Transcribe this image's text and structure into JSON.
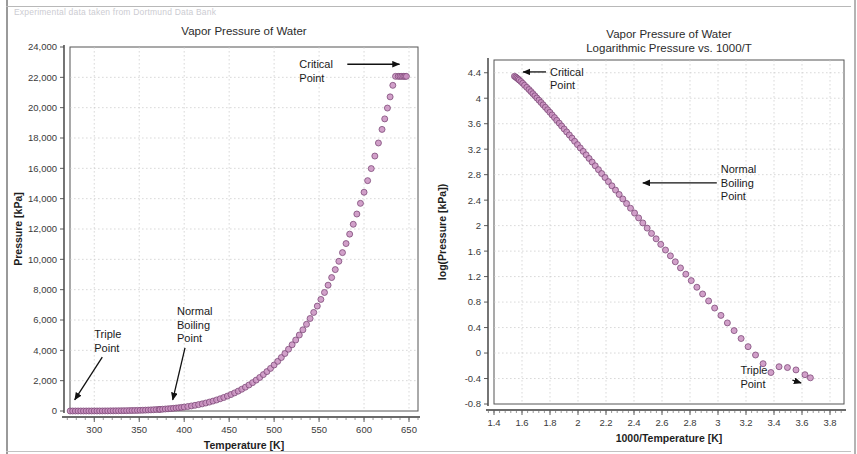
{
  "document": {
    "caption_note": "Experimental data taken from Dortmund Data Bank"
  },
  "chart_data": [
    {
      "id": "left",
      "type": "scatter",
      "title": "Vapor Pressure of Water",
      "xlabel": "Temperature [K]",
      "ylabel": "Pressure [kPa]",
      "xlim": [
        273,
        660
      ],
      "ylim": [
        0,
        24000
      ],
      "xticks": [
        300,
        350,
        400,
        450,
        500,
        550,
        600,
        650
      ],
      "xtick_labels": [
        "300",
        "350",
        "400",
        "450",
        "500",
        "550",
        "600",
        "650"
      ],
      "yticks": [
        0,
        2000,
        4000,
        6000,
        8000,
        10000,
        12000,
        14000,
        16000,
        18000,
        20000,
        22000,
        24000
      ],
      "ytick_labels": [
        "0",
        "2,000",
        "4,000",
        "6,000",
        "8,000",
        "10,000",
        "12,000",
        "14,000",
        "16,000",
        "18,000",
        "20,000",
        "22,000",
        "24,000"
      ],
      "grid": true,
      "legend": "none",
      "marker_color": "#c98fc0",
      "marker_edge_color": "#7d4a78",
      "series": [
        {
          "name": "Vapor pressure of water",
          "x": [
            273.2,
            276.0,
            279.0,
            282.0,
            285.0,
            288.0,
            291.0,
            294.0,
            297.0,
            300.0,
            303.0,
            306.0,
            309.0,
            312.0,
            315.0,
            318.0,
            321.0,
            324.0,
            327.0,
            330.0,
            333.0,
            336.0,
            339.0,
            342.0,
            345.0,
            348.0,
            351.0,
            354.0,
            357.0,
            360.0,
            363.0,
            366.0,
            369.0,
            372.0,
            373.15,
            376.0,
            379.0,
            382.0,
            385.0,
            388.0,
            391.0,
            394.0,
            397.0,
            400.0,
            404.0,
            408.0,
            412.0,
            416.0,
            420.0,
            424.0,
            428.0,
            432.0,
            436.0,
            440.0,
            444.0,
            448.0,
            452.0,
            456.0,
            460.0,
            464.0,
            468.0,
            472.0,
            476.0,
            480.0,
            484.0,
            488.0,
            492.0,
            496.0,
            500.0,
            504.0,
            508.0,
            512.0,
            516.0,
            520.0,
            524.0,
            528.0,
            532.0,
            536.0,
            540.0,
            544.0,
            548.0,
            552.0,
            556.0,
            560.0,
            564.0,
            568.0,
            572.0,
            576.0,
            580.0,
            584.0,
            588.0,
            592.0,
            596.0,
            600.0,
            604.0,
            608.0,
            612.0,
            616.0,
            620.0,
            623.0,
            626.0,
            629.0,
            632.0,
            635.0,
            638.0,
            640.0,
            642.0,
            644.0,
            645.5,
            647.1
          ],
          "y": [
            0.61,
            0.83,
            1.0,
            1.2,
            1.4,
            1.7,
            2.1,
            2.5,
            3.0,
            3.5,
            4.2,
            5.0,
            5.9,
            7.0,
            8.2,
            9.6,
            11.2,
            13.1,
            15.2,
            17.6,
            20.3,
            23.4,
            26.8,
            30.7,
            35.1,
            40.0,
            45.5,
            51.5,
            58.3,
            65.8,
            74.1,
            83.3,
            93.4,
            104.5,
            101.3,
            118.0,
            131.0,
            145.0,
            160.0,
            177.0,
            196.0,
            216.0,
            238.0,
            261.0,
            295.0,
            333.0,
            375.0,
            421.0,
            471.0,
            527.0,
            588.0,
            654.0,
            727.0,
            806.0,
            891.0,
            984.0,
            1085.0,
            1193.0,
            1310.0,
            1435.0,
            1570.0,
            1715.0,
            1870.0,
            2035.0,
            2211.0,
            2399.0,
            2598.0,
            2810.0,
            3035.0,
            3273.0,
            3525.0,
            3791.0,
            4072.0,
            4368.0,
            4680.0,
            5009.0,
            5354.0,
            5717.0,
            6098.0,
            6498.0,
            6917.0,
            7356.0,
            7815.0,
            8296.0,
            8798.0,
            9323.0,
            9871.0,
            10443.0,
            11040.0,
            11662.0,
            12311.0,
            12987.0,
            13691.0,
            14424.0,
            15188.0,
            15983.0,
            16810.0,
            17671.0,
            18567.0,
            19260.0,
            19975.0,
            20712.0,
            21472.0,
            22064.0,
            22064.0,
            22064.0,
            22064.0,
            22064.0,
            22064.0,
            22064.0
          ]
        }
      ],
      "annotations": [
        {
          "text": "Critical\nPoint",
          "lines": [
            "Critical",
            "Point"
          ],
          "arrow": "right",
          "label_x": 528,
          "label_y": 22600,
          "point_x": 645,
          "point_y": 22000
        },
        {
          "text": "Triple\nPoint",
          "lines": [
            "Triple",
            "Point"
          ],
          "arrow": "down",
          "label_x": 300,
          "label_y": 4800,
          "point_x": 276,
          "point_y": 400
        },
        {
          "text": "Normal\nBoiling\nPoint",
          "lines": [
            "Normal",
            "Boiling",
            "Point"
          ],
          "arrow": "down",
          "label_x": 392,
          "label_y": 6300,
          "point_x": 385,
          "point_y": 400
        }
      ]
    },
    {
      "id": "right",
      "type": "scatter",
      "title": "Vapor Pressure of Water",
      "subtitle": "Logarithmic Pressure vs. 1000/T",
      "xlabel": "1000/Temperature [K]",
      "ylabel": "log(Pressure [kPa])",
      "xlim": [
        1.4,
        3.9
      ],
      "ylim": [
        -0.8,
        4.6
      ],
      "xticks": [
        1.4,
        1.6,
        1.8,
        2.0,
        2.2,
        2.4,
        2.6,
        2.8,
        3.0,
        3.2,
        3.4,
        3.6,
        3.8
      ],
      "xtick_labels": [
        "1.4",
        "1.6",
        "1.8",
        "2",
        "2.2",
        "2.4",
        "2.6",
        "2.8",
        "3",
        "3.2",
        "3.4",
        "3.6",
        "3.8"
      ],
      "yticks": [
        -0.8,
        -0.4,
        0,
        0.4,
        0.8,
        1.2,
        1.6,
        2.0,
        2.4,
        2.8,
        3.2,
        3.6,
        4.0,
        4.4
      ],
      "ytick_labels": [
        "-0.8",
        "-0.4",
        "0",
        "0.4",
        "0.8",
        "1.2",
        "1.6",
        "2",
        "2.4",
        "2.8",
        "3.2",
        "3.6",
        "4",
        "4.4"
      ],
      "grid": true,
      "legend": "none",
      "marker_color": "#c98fc0",
      "marker_edge_color": "#7d4a78",
      "series": [
        {
          "name": "log vapor pressure vs 1000/T",
          "x": [
            1.546,
            1.555,
            1.563,
            1.572,
            1.58,
            1.592,
            1.605,
            1.618,
            1.634,
            1.65,
            1.664,
            1.678,
            1.692,
            1.706,
            1.721,
            1.736,
            1.751,
            1.767,
            1.783,
            1.799,
            1.815,
            1.832,
            1.848,
            1.866,
            1.883,
            1.901,
            1.919,
            1.938,
            1.957,
            1.976,
            1.996,
            2.016,
            2.037,
            2.058,
            2.079,
            2.101,
            2.123,
            2.146,
            2.169,
            2.193,
            2.217,
            2.242,
            2.268,
            2.294,
            2.32,
            2.347,
            2.375,
            2.404,
            2.433,
            2.463,
            2.494,
            2.525,
            2.558,
            2.591,
            2.625,
            2.66,
            2.695,
            2.732,
            2.77,
            2.809,
            2.849,
            2.89,
            2.933,
            2.976,
            3.021,
            3.067,
            3.115,
            3.165,
            3.215,
            3.268,
            3.322,
            3.378,
            3.436,
            3.496,
            3.557,
            3.621,
            3.66
          ],
          "y": [
            4.344,
            4.332,
            4.317,
            4.302,
            4.285,
            4.262,
            4.235,
            4.204,
            4.171,
            4.136,
            4.104,
            4.071,
            4.038,
            4.004,
            3.969,
            3.933,
            3.896,
            3.858,
            3.819,
            3.779,
            3.738,
            3.696,
            3.653,
            3.609,
            3.564,
            3.518,
            3.471,
            3.423,
            3.374,
            3.324,
            3.272,
            3.22,
            3.166,
            3.111,
            3.055,
            2.998,
            2.939,
            2.879,
            2.818,
            2.755,
            2.691,
            2.625,
            2.558,
            2.489,
            2.419,
            2.347,
            2.273,
            2.198,
            2.121,
            2.042,
            1.961,
            1.878,
            1.793,
            1.706,
            1.617,
            1.526,
            1.432,
            1.336,
            1.238,
            1.137,
            1.033,
            0.927,
            0.818,
            0.706,
            0.591,
            0.473,
            0.352,
            0.228,
            0.1,
            -0.031,
            -0.167,
            -0.306,
            -0.215,
            -0.228,
            -0.265,
            -0.34,
            -0.389
          ]
        }
      ],
      "annotations": [
        {
          "text": "Critical\nPoint",
          "lines": [
            "Critical",
            "Point"
          ],
          "arrow": "left",
          "label_x": 1.8,
          "label_y": 4.35,
          "point_x": 1.565,
          "point_y": 4.3
        },
        {
          "text": "Normal\nBoiling\nPoint",
          "lines": [
            "Normal",
            "Boiling",
            "Point"
          ],
          "arrow": "left",
          "label_x": 3.02,
          "label_y": 2.82,
          "point_x": 2.42,
          "point_y": 2.33
        },
        {
          "text": "Triple\nPoint",
          "lines": [
            "Triple",
            "Point"
          ],
          "arrow": "upright",
          "label_x": 3.16,
          "label_y": -0.33,
          "point_x": 3.63,
          "point_y": -0.36
        }
      ]
    }
  ]
}
